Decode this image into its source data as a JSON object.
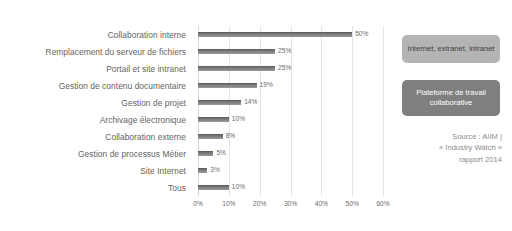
{
  "chart_data": {
    "type": "bar",
    "orientation": "horizontal",
    "title": "",
    "xlabel": "",
    "ylabel": "",
    "xlim": [
      0,
      60
    ],
    "grid": true,
    "legend": "none",
    "categories": [
      "Collaboration interne",
      "Remplacement du serveur de fichiers",
      "Portail et site intranet",
      "Gestion de contenu documentaire",
      "Gestion de projet",
      "Archivage électronique",
      "Collaboration externe",
      "Gestion de processus Métier",
      "Site Internet",
      "Tous"
    ],
    "values": [
      50,
      25,
      25,
      19,
      14,
      10,
      8,
      5,
      3,
      10
    ],
    "value_labels": [
      "50%",
      "25%",
      "25%",
      "19%",
      "14%",
      "10%",
      "8%",
      "5%",
      "3%",
      "10%"
    ],
    "xticks": [
      0,
      10,
      20,
      30,
      40,
      50,
      60
    ],
    "xtick_labels": [
      "0%",
      "10%",
      "20%",
      "30%",
      "40%",
      "50%",
      "60%"
    ],
    "bar_color": "#7d7d7d"
  },
  "annotations": {
    "callout_light": "Internet, extranet, intranet",
    "callout_dark": "Plateforme de travail collaborative",
    "source_line1": "Source : AIIM |",
    "source_line2": "« Industry Watch »",
    "source_line3": "rapport 2014"
  },
  "colors": {
    "callout_light_bg": "#b4b4b4",
    "callout_dark_bg": "#7f7f7f",
    "bar": "#7d7d7d",
    "gridline": "#e4e4e4",
    "text": "#636363"
  }
}
